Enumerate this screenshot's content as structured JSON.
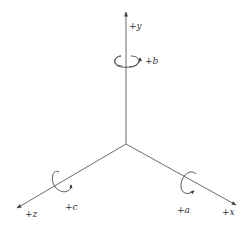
{
  "diagram": {
    "colors": {
      "axis": "#6a6a6a",
      "text": "#333333",
      "background": "#ffffff"
    },
    "axes": [
      {
        "id": "y",
        "label": "+y",
        "rotation_label": "+b"
      },
      {
        "id": "x",
        "label": "+x",
        "rotation_label": "+a"
      },
      {
        "id": "z",
        "label": "+z",
        "rotation_label": "+c"
      }
    ]
  }
}
